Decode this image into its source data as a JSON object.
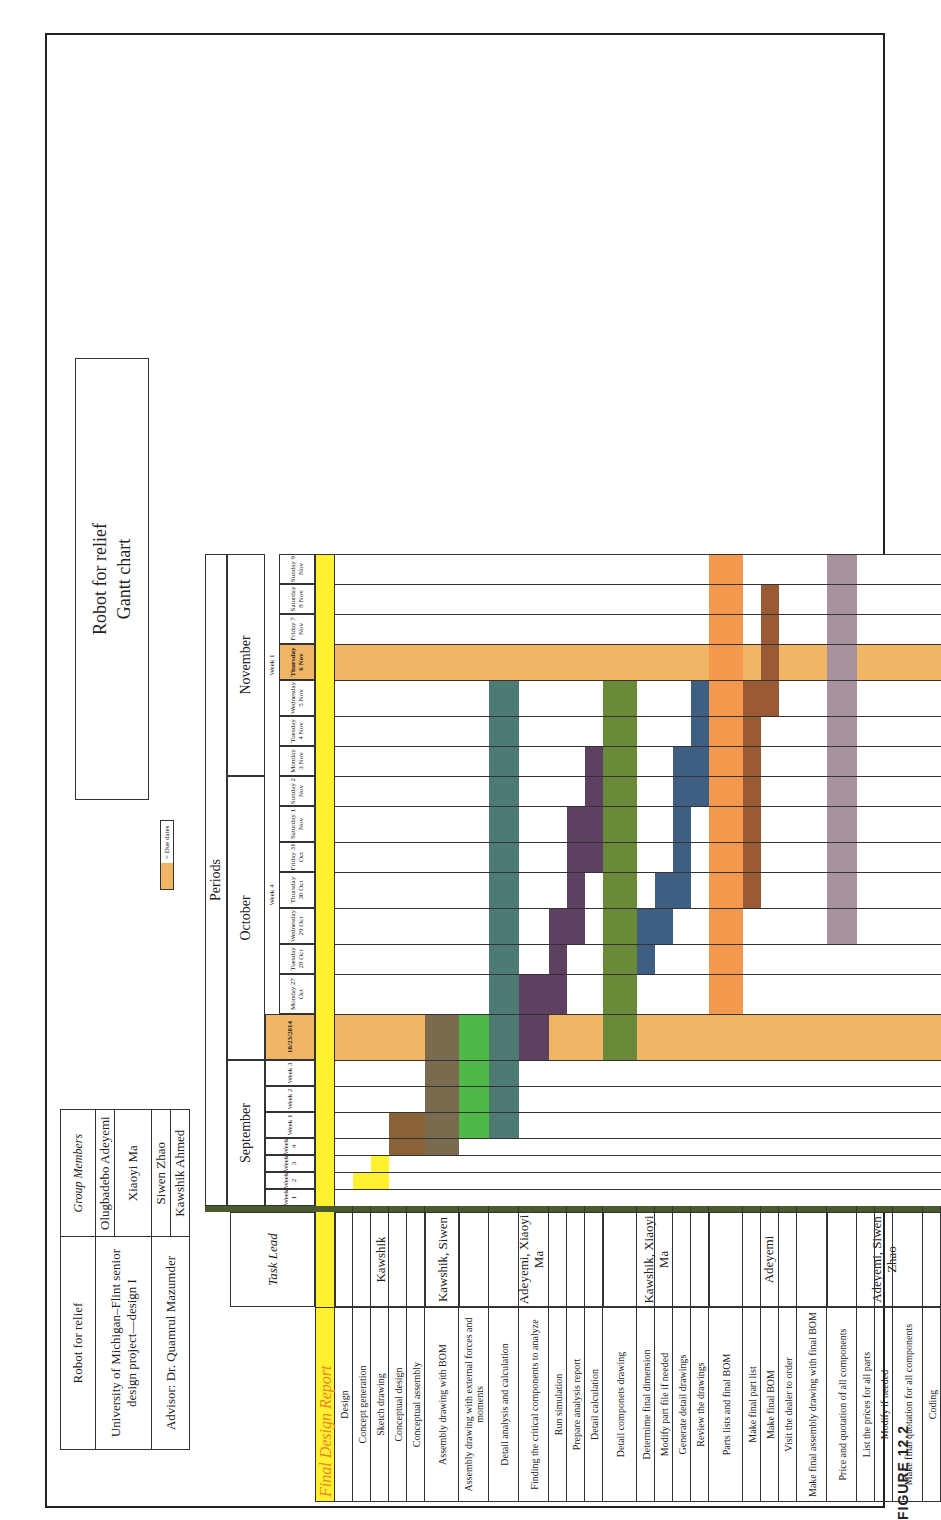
{
  "header": {
    "project": "Robot for relief",
    "university": "University of Michigan–Flint senior design project—design I",
    "advisor": "Advisor: Dr. Quamrul Mazumder",
    "group_members_label": "Group Members",
    "members": [
      "Olugbadebo Adeyemi",
      "Xiaoyi Ma",
      "Siwen Zhao",
      "Kawshik Ahmed"
    ],
    "title_line1": "Robot for relief",
    "title_line2": "Gantt chart",
    "legend_label": "= Due dates"
  },
  "caption": "FIGURE 12.2",
  "colors": {
    "yellow": "#fff030",
    "due": "#f0b565",
    "separator": "#4a5a2e"
  },
  "chart_data": {
    "type": "gantt",
    "title": "Robot for relief Gantt chart",
    "section": "Final Design Report",
    "task_lead_header": "Task Lead",
    "periods_header": "Periods",
    "months": [
      "September",
      "October",
      "November"
    ],
    "week_labels": {
      "october_week": "Week 4",
      "november_week": "Week 1"
    },
    "columns": [
      "Week 1",
      "Week 2",
      "Week 3",
      "Week 4",
      "Week 1",
      "Week 2",
      "Week 3",
      "10/23/2014",
      "Monday 27 Oct",
      "Tuesday 28 Oct",
      "Wednesday 29 Oct",
      "Thursday 30 Oct",
      "Friday 31 Oct",
      "Saturday 1 Nov",
      "Sunday 2 Nov",
      "Monday 3 Nov",
      "Tuesday 4 Nov",
      "Wednesday 5 Nov",
      "Thursday 6 Nov",
      "Friday 7 Nov",
      "Saturday 8 Nov",
      "Sunday 9 Nov"
    ],
    "due_dates": [
      "10/23/2014",
      "Thursday 6 Nov"
    ],
    "groups": [
      {
        "lead": "Kawshik",
        "tasks": [
          {
            "name": "Design",
            "start": null,
            "end": null,
            "color": null
          },
          {
            "name": "Concept generation",
            "start": 1,
            "end": 1,
            "color": "#fff030"
          },
          {
            "name": "Sketch drawing",
            "start": 1,
            "end": 2,
            "color": "#fff030"
          },
          {
            "name": "Conceptual design",
            "start": 3,
            "end": 4,
            "color": "#8a6238"
          },
          {
            "name": "Conceptual assembly",
            "start": 3,
            "end": 4,
            "color": "#8a6238"
          }
        ]
      },
      {
        "lead": "Kawshik, Siwen",
        "tasks": [
          {
            "name": "Assembly drawing with BOM",
            "start": 3,
            "end": 7,
            "color": "#7a6a4e"
          }
        ]
      },
      {
        "lead": "Adeyemi, Xiaoyi Ma",
        "tasks": [
          {
            "name": "Assembly drawing with external forces and moments",
            "start": 4,
            "end": 7,
            "color": "#4fb848"
          },
          {
            "name": "Detail analysis and calculation",
            "start": 4,
            "end": 17,
            "color": "#4e7a74"
          },
          {
            "name": "Finding the critical components to analyze",
            "start": 7,
            "end": 8,
            "color": "#5e4060"
          },
          {
            "name": "Run simulation",
            "start": 8,
            "end": 10,
            "color": "#5e4060"
          },
          {
            "name": "Prepare analysis report",
            "start": 10,
            "end": 13,
            "color": "#5e4060"
          },
          {
            "name": "Detail calculation",
            "start": 12,
            "end": 15,
            "color": "#5e4060"
          }
        ]
      },
      {
        "lead": "Kawshik, Xiaoyi Ma",
        "tasks": [
          {
            "name": "Detail componets drawing",
            "start": 7,
            "end": 17,
            "color": "#6a8a3a"
          },
          {
            "name": "Determime final dimension",
            "start": 9,
            "end": 10,
            "color": "#3e5e82"
          },
          {
            "name": "Modify part file if needed",
            "start": 10,
            "end": 11,
            "color": "#3e5e82"
          },
          {
            "name": "Generate detail drawings",
            "start": 11,
            "end": 15,
            "color": "#3e5e82"
          },
          {
            "name": "Review the drawings",
            "start": 14,
            "end": 17,
            "color": "#3e5e82"
          }
        ]
      },
      {
        "lead": "Adeyemi",
        "tasks": [
          {
            "name": "Parts lists and final BOM",
            "start": 8,
            "end": 21,
            "color": "#f5994e"
          },
          {
            "name": "Make final part list",
            "start": 11,
            "end": 17,
            "color": "#9a5a36"
          },
          {
            "name": "Make final BOM",
            "start": 17,
            "end": 20,
            "color": "#9a5a36"
          },
          {
            "name": "Visit the dealer to order",
            "start": null,
            "end": null,
            "color": null
          },
          {
            "name": "Make final assembly drawing with final BOM",
            "start": null,
            "end": null,
            "color": null
          }
        ]
      },
      {
        "lead": "Adeyemi, Siwen Zhao",
        "tasks": [
          {
            "name": "Price and quotation of all components",
            "start": 10,
            "end": 21,
            "color": "#a8929e"
          },
          {
            "name": "List the prices for all parts",
            "start": null,
            "end": null,
            "color": null
          },
          {
            "name": "Modify if needed",
            "start": null,
            "end": null,
            "color": null
          },
          {
            "name": "Make final quotation for all components",
            "start": null,
            "end": null,
            "color": null
          },
          {
            "name": "Coding",
            "start": null,
            "end": null,
            "color": null
          }
        ]
      }
    ]
  }
}
